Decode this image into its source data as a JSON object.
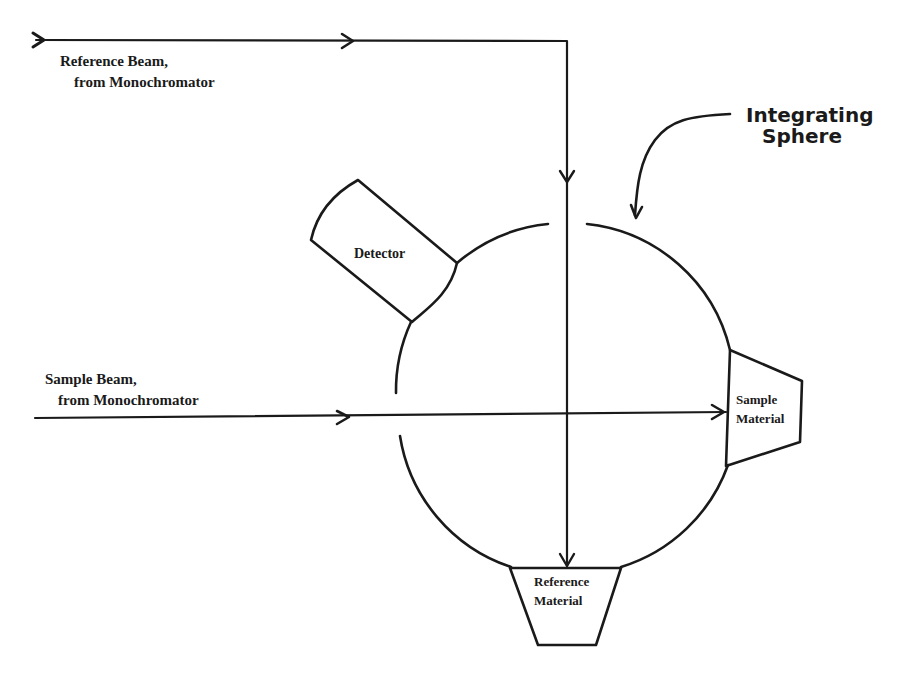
{
  "diagram": {
    "type": "integrating-sphere-schematic",
    "labels": {
      "reference_beam_line1": "Reference Beam,",
      "reference_beam_line2": "from Monochromator",
      "sample_beam_line1": "Sample Beam,",
      "sample_beam_line2": "from Monochromator",
      "integrating_sphere_line1": "Integrating",
      "integrating_sphere_line2": "Sphere",
      "detector": "Detector",
      "sample_material_line1": "Sample",
      "sample_material_line2": "Material",
      "reference_material_line1": "Reference",
      "reference_material_line2": "Material"
    },
    "components": [
      {
        "id": "integrating-sphere",
        "label": "Integrating Sphere"
      },
      {
        "id": "detector",
        "label": "Detector"
      },
      {
        "id": "sample-material",
        "label": "Sample Material"
      },
      {
        "id": "reference-material",
        "label": "Reference Material"
      }
    ],
    "beams": [
      {
        "id": "reference-beam",
        "label": "Reference Beam, from Monochromator",
        "path": "enters top-left, travels right, turns down through sphere to Reference Material"
      },
      {
        "id": "sample-beam",
        "label": "Sample Beam, from Monochromator",
        "path": "enters left, travels right through sphere to Sample Material"
      }
    ],
    "colors": {
      "ink": "#1a1a1a",
      "background": "#ffffff"
    }
  }
}
